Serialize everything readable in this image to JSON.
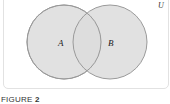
{
  "diagram": {
    "type": "venn",
    "universe_label": "U",
    "sets": [
      {
        "label": "A",
        "cx": 64,
        "cy": 42,
        "r": 37
      },
      {
        "label": "B",
        "cx": 110,
        "cy": 42,
        "r": 37
      }
    ],
    "colors": {
      "fill": "#dcdcdc",
      "stroke": "#9a9a9a",
      "text": "#222222"
    }
  },
  "caption": {
    "prefix": "FIGURE",
    "number": "2"
  }
}
